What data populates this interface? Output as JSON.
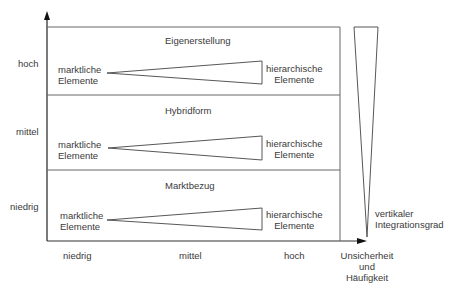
{
  "y_axis": {
    "ticks": [
      "hoch",
      "mittel",
      "niedrig"
    ]
  },
  "x_axis": {
    "ticks": [
      "niedrig",
      "mittel",
      "hoch"
    ],
    "label_line1": "Unsicherheit",
    "label_line2": "und",
    "label_line3": "Häufigkeit"
  },
  "bands": [
    {
      "title": "Eigenerstellung",
      "left_line1": "marktliche",
      "left_line2": "Elemente",
      "right_line1": "hierarchische",
      "right_line2": "Elemente"
    },
    {
      "title": "Hybridform",
      "left_line1": "marktliche",
      "left_line2": "Elemente",
      "right_line1": "hierarchische",
      "right_line2": "Elemente"
    },
    {
      "title": "Marktbezug",
      "left_line1": "marktliche",
      "left_line2": "Elemente",
      "right_line1": "hierarchische",
      "right_line2": "Elemente"
    }
  ],
  "wedge": {
    "label_line1": "vertikaler",
    "label_line2": "Integrationsgrad"
  },
  "colors": {
    "line": "#555555",
    "text": "#3a3a3a"
  }
}
